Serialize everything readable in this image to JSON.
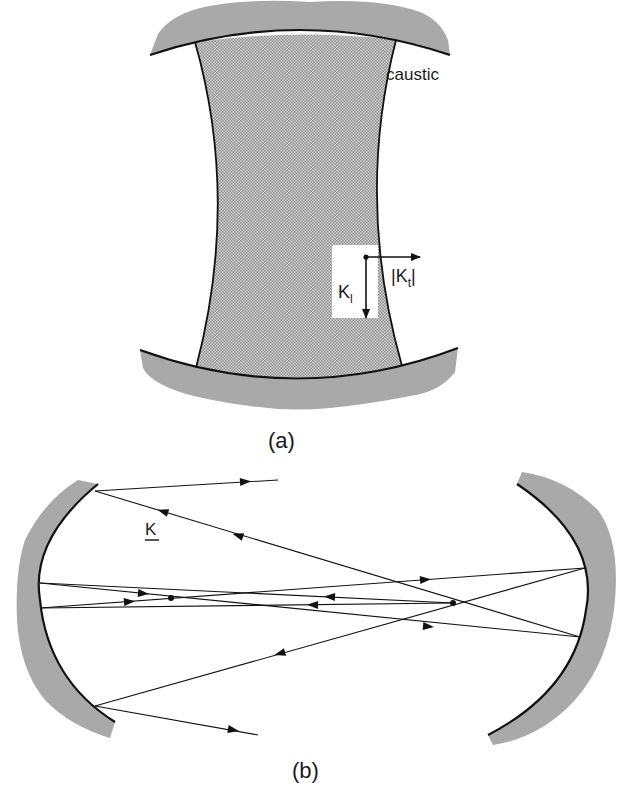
{
  "figure_a": {
    "caption": "(a)",
    "caustic_label": "caustic",
    "vector_transverse": {
      "bar_left": "|",
      "symbol": "K",
      "subscript": "t",
      "bar_right": "|"
    },
    "vector_longitudinal": {
      "symbol": "K",
      "subscript": "l"
    }
  },
  "figure_b": {
    "caption": "(b)",
    "wavevector_label": "K"
  },
  "colors": {
    "mirror_shading": "#a9a9a9",
    "caustic_fill": "#bdbdbd",
    "line": "#111111",
    "background": "#ffffff"
  }
}
